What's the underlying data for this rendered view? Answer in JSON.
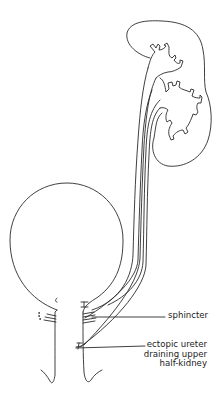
{
  "diagram": {
    "labels": {
      "sphincter": "sphincter",
      "ectopic_line1": "ectopic ureter",
      "ectopic_line2": "draining upper",
      "ectopic_line3": "half-kidney"
    },
    "stroke_color": "#2a2a2a",
    "background": "#ffffff"
  }
}
